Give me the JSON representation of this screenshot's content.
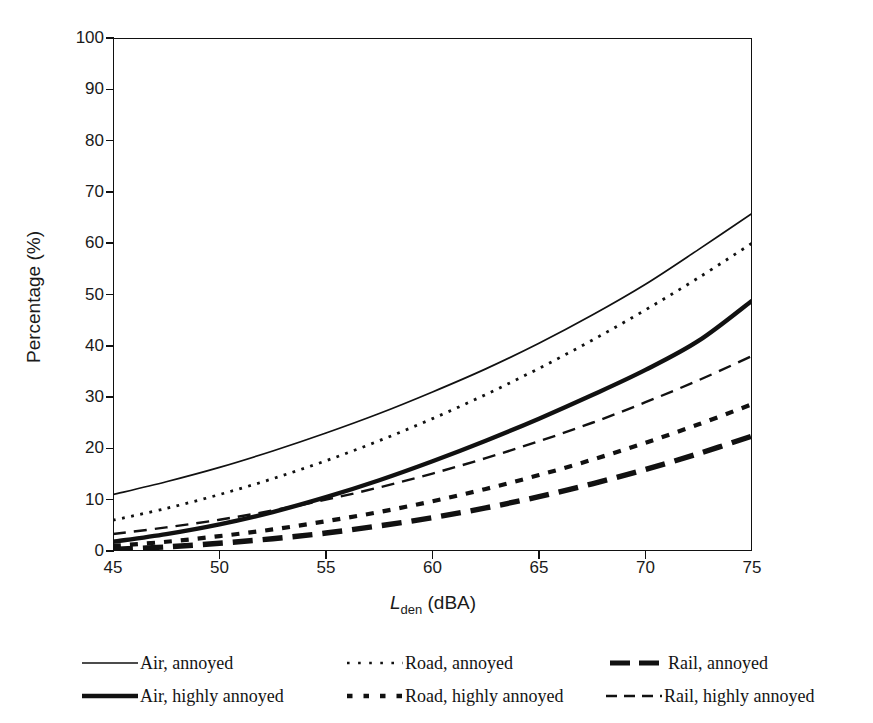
{
  "chart_data": {
    "type": "line",
    "title": "",
    "xlabel": "Lden (dBA)",
    "xlabel_main": "L",
    "xlabel_sub": "den",
    "xlabel_unit": " (dBA)",
    "ylabel": "Percentage (%)",
    "xlim": [
      45,
      75
    ],
    "ylim": [
      0,
      100
    ],
    "xticks": [
      45,
      50,
      55,
      60,
      65,
      70,
      75
    ],
    "yticks": [
      0,
      10,
      20,
      30,
      40,
      50,
      60,
      70,
      80,
      90,
      100
    ],
    "grid": false,
    "legend_position": "below",
    "x": [
      45,
      47.5,
      50,
      52.5,
      55,
      57.5,
      60,
      62.5,
      65,
      67.5,
      70,
      72.5,
      75
    ],
    "series": [
      {
        "name": "Air, annoyed",
        "key": "air_annoyed",
        "style": "thin-solid",
        "values": [
          11.0,
          13.5,
          16.3,
          19.5,
          23.0,
          26.8,
          31.0,
          35.5,
          40.5,
          46.0,
          52.0,
          58.8,
          65.8
        ]
      },
      {
        "name": "Air, highly annoyed",
        "key": "air_highly_annoyed",
        "style": "thick-solid",
        "values": [
          1.8,
          3.3,
          5.2,
          7.6,
          10.5,
          13.8,
          17.5,
          21.5,
          25.8,
          30.4,
          35.3,
          41.0,
          48.8
        ]
      },
      {
        "name": "Road, annoyed",
        "key": "road_annoyed",
        "style": "fine-dotted",
        "values": [
          6.0,
          8.3,
          11.0,
          14.1,
          17.6,
          21.5,
          25.8,
          30.5,
          35.6,
          41.1,
          47.0,
          53.3,
          60.0
        ]
      },
      {
        "name": "Road, highly annoyed",
        "key": "road_highly_annoyed",
        "style": "thick-dashed",
        "values": [
          1.0,
          1.8,
          2.9,
          4.2,
          5.8,
          7.6,
          9.7,
          12.1,
          14.8,
          17.8,
          21.1,
          24.7,
          28.6
        ]
      },
      {
        "name": "Rail, annoyed",
        "key": "rail_annoyed",
        "style": "extra-thick-dashed",
        "values": [
          0.3,
          0.8,
          1.5,
          2.4,
          3.5,
          4.9,
          6.5,
          8.4,
          10.6,
          13.1,
          15.9,
          19.0,
          22.4
        ]
      },
      {
        "name": "Rail, highly annoyed",
        "key": "rail_highly_annoyed",
        "style": "thin-dashed",
        "values": [
          3.3,
          4.6,
          6.1,
          7.9,
          10.0,
          12.4,
          15.1,
          18.1,
          21.4,
          25.0,
          29.0,
          33.3,
          38.0
        ]
      }
    ]
  },
  "axis": {
    "ylabel": "Percentage (%)",
    "xlabel_main": "L",
    "xlabel_sub": "den",
    "xlabel_unit": "(dBA)"
  },
  "legend": {
    "items": [
      {
        "label": "Air, annoyed",
        "style": "thin-solid"
      },
      {
        "label": "Road, annoyed",
        "style": "fine-dotted"
      },
      {
        "label": "Rail, annoyed",
        "style": "extra-thick-dashed"
      },
      {
        "label": "Air, highly annoyed",
        "style": "thick-solid"
      },
      {
        "label": "Road, highly annoyed",
        "style": "thick-dashed"
      },
      {
        "label": "Rail, highly annoyed",
        "style": "thin-dashed"
      }
    ]
  },
  "colors": {
    "line": "#111111",
    "background": "#ffffff",
    "text": "#141414"
  }
}
